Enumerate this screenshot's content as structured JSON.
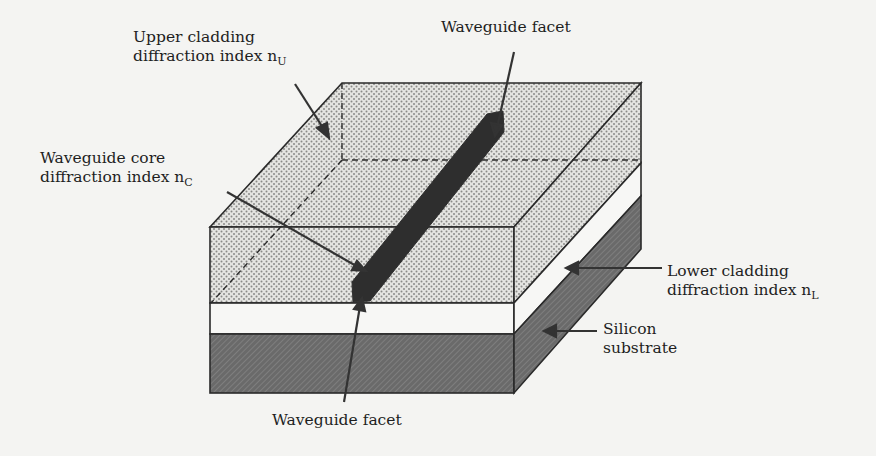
{
  "figure": {
    "labels": {
      "upper_cladding": {
        "line1": "Upper cladding",
        "line2": "diffraction index n",
        "subscript": "U"
      },
      "core": {
        "line1": "Waveguide core",
        "line2": "diffraction index n",
        "subscript": "C"
      },
      "facet_top": {
        "text": "Waveguide facet"
      },
      "facet_bottom": {
        "text": "Waveguide facet"
      },
      "lower_cladding": {
        "line1": "Lower cladding",
        "line2": "diffraction index n",
        "subscript": "L"
      },
      "substrate": {
        "line1": "Silicon",
        "line2": "substrate"
      }
    },
    "layers": [
      {
        "name": "upper cladding",
        "fill": "dotted",
        "color": "#d9d9d6"
      },
      {
        "name": "lower cladding",
        "fill": "plain",
        "color": "#f7f7f5"
      },
      {
        "name": "silicon substrate",
        "fill": "hatched",
        "color": "#6e6e6e"
      },
      {
        "name": "waveguide core",
        "fill": "solid",
        "color": "#2e2e2e"
      }
    ]
  }
}
